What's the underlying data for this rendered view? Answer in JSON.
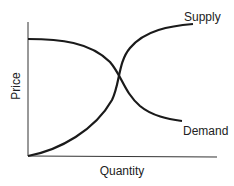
{
  "diagram": {
    "type": "supply-demand",
    "x_axis_label": "Quantity",
    "y_axis_label": "Price",
    "curves": [
      {
        "name": "Supply",
        "shape": "increasing, S-shaped, flattening at top"
      },
      {
        "name": "Demand",
        "shape": "decreasing, flat at top then falling and flattening"
      }
    ],
    "equilibrium": "intersection of supply and demand near center"
  },
  "labels": {
    "supply": "Supply",
    "demand": "Demand",
    "price": "Price",
    "quantity": "Quantity"
  },
  "colors": {
    "line": "#1a1a1a",
    "axis": "#333333",
    "background": "#ffffff"
  }
}
